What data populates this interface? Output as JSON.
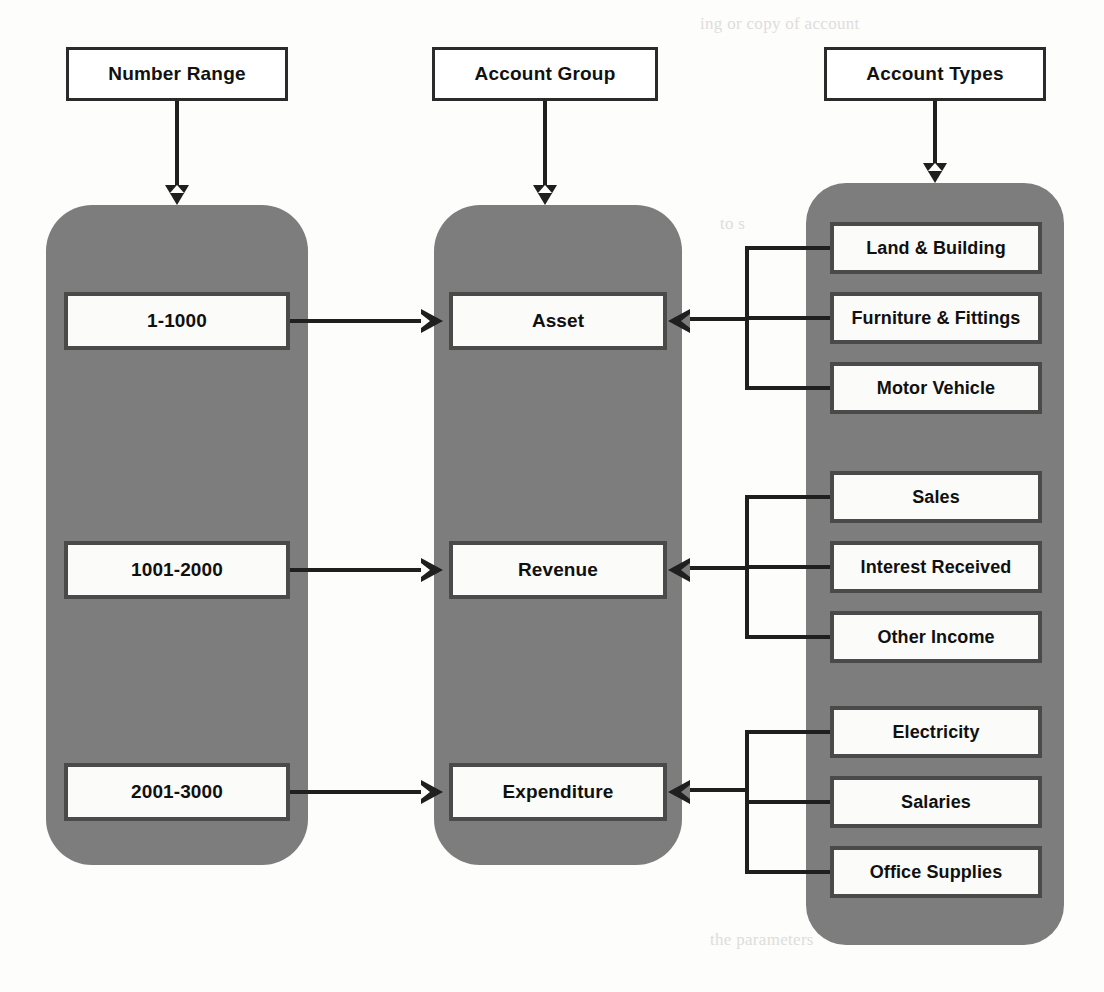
{
  "diagram": {
    "colors": {
      "panel_gray": "#7d7d7d",
      "box_fill": "#fbfbfa",
      "line_black": "#1f1f1f",
      "page_white": "#fdfdfc"
    }
  },
  "headers": [
    {
      "id": "number-range",
      "label": "Number Range"
    },
    {
      "id": "account-group",
      "label": "Account Group"
    },
    {
      "id": "account-types",
      "label": "Account Types"
    }
  ],
  "number_ranges": [
    {
      "id": "range-asset",
      "label": "1-1000"
    },
    {
      "id": "range-revenue",
      "label": "1001-2000"
    },
    {
      "id": "range-expenditure",
      "label": "2001-3000"
    }
  ],
  "account_groups": [
    {
      "id": "group-asset",
      "label": "Asset"
    },
    {
      "id": "group-revenue",
      "label": "Revenue"
    },
    {
      "id": "group-expenditure",
      "label": "Expenditure"
    }
  ],
  "account_types": {
    "asset": [
      {
        "id": "type-land-building",
        "label": "Land & Building"
      },
      {
        "id": "type-furniture-fittings",
        "label": "Furniture & Fittings"
      },
      {
        "id": "type-motor-vehicle",
        "label": "Motor Vehicle"
      }
    ],
    "revenue": [
      {
        "id": "type-sales",
        "label": "Sales"
      },
      {
        "id": "type-interest-received",
        "label": "Interest Received"
      },
      {
        "id": "type-other-income",
        "label": "Other Income"
      }
    ],
    "expenditure": [
      {
        "id": "type-electricity",
        "label": "Electricity"
      },
      {
        "id": "type-salaries",
        "label": "Salaries"
      },
      {
        "id": "type-office-supplies",
        "label": "Office Supplies"
      }
    ]
  },
  "background_text": {
    "line1": "ing or copy of account",
    "line2": "for its credit and MIG",
    "line3": "to s",
    "line4": "to create the account",
    "line5": "the parameters"
  }
}
